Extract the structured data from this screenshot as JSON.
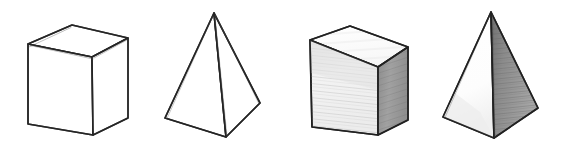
{
  "figure": {
    "title": "Four hand-drawn geometric solids",
    "description": "Pencil sketch row of four solids: an unshaded cube, an unshaded square pyramid, a shaded cube, and a shaded square pyramid.",
    "background_color": "#ffffff",
    "width": 564,
    "height": 149,
    "stroke_color": "#2b2b2b"
  },
  "palette": {
    "outline": "#2b2b2b",
    "outline_soft": "#3a3a3a",
    "paper_white": "#ffffff",
    "face_top_light": "#fbfbfb",
    "face_front_light": "#efefef",
    "face_right_mid": "#9a9a9a",
    "face_right_dark": "#8a8a8a",
    "shadow_tint": "#d8d8d8"
  },
  "objects": [
    {
      "index": 1,
      "name": "cube-outline",
      "label": "Cube (outline)",
      "shaded": false,
      "faces": [
        "top",
        "front",
        "right"
      ],
      "vertices": {
        "top_left": [
          28,
          44
        ],
        "top_back": [
          72,
          25
        ],
        "top_right": [
          128,
          38
        ],
        "top_front": [
          92,
          57
        ],
        "bottom_left": [
          28,
          124
        ],
        "bottom_front": [
          93,
          135
        ],
        "bottom_right": [
          128,
          118
        ]
      },
      "fill": {
        "top": "#ffffff",
        "front": "#ffffff",
        "right": "#ffffff"
      }
    },
    {
      "index": 2,
      "name": "pyramid-outline",
      "label": "Square pyramid (outline)",
      "shaded": false,
      "faces": [
        "left",
        "right"
      ],
      "vertices": {
        "apex": [
          214,
          13
        ],
        "base_left": [
          165,
          118
        ],
        "base_front": [
          226,
          137
        ],
        "base_right": [
          260,
          103
        ]
      },
      "fill": {
        "left": "#ffffff",
        "right": "#ffffff"
      }
    },
    {
      "index": 3,
      "name": "cube-shaded",
      "label": "Cube (shaded)",
      "shaded": true,
      "faces": [
        "top",
        "front",
        "right"
      ],
      "vertices": {
        "top_left": [
          310,
          40
        ],
        "top_back": [
          350,
          26
        ],
        "top_right": [
          408,
          47
        ],
        "top_front": [
          378,
          67
        ],
        "bottom_left": [
          312,
          127
        ],
        "bottom_front": [
          378,
          135
        ],
        "bottom_right": [
          408,
          120
        ]
      },
      "fill": {
        "top": "#fbfbfb",
        "front": "#efefef",
        "right": "#9a9a9a"
      }
    },
    {
      "index": 4,
      "name": "pyramid-shaded",
      "label": "Square pyramid (shaded)",
      "shaded": true,
      "faces": [
        "left",
        "right"
      ],
      "vertices": {
        "apex": [
          491,
          12
        ],
        "base_left": [
          443,
          117
        ],
        "base_front": [
          494,
          138
        ],
        "base_right": [
          538,
          108
        ]
      },
      "fill": {
        "left": "#fdfdfd",
        "right": "#8a8a8a"
      }
    }
  ]
}
